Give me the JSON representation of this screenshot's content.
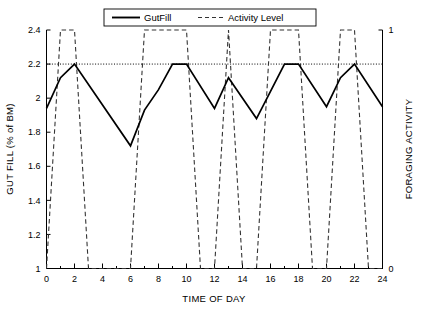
{
  "chart_data": {
    "type": "line",
    "title": "",
    "xlabel": "TIME OF DAY",
    "ylabel": "GUT FILL (% of BM)",
    "y2label": "FORAGING ACTIVITY",
    "xlim": [
      0,
      24
    ],
    "ylim": [
      1,
      2.4
    ],
    "y2lim": [
      0,
      1
    ],
    "xticks": [
      0,
      2,
      4,
      6,
      8,
      10,
      12,
      14,
      16,
      18,
      20,
      22,
      24
    ],
    "xtick_labels": [
      "0",
      "2",
      "4",
      "6",
      "8",
      "10",
      "12",
      "14",
      "16",
      "18",
      "20",
      "22",
      "24"
    ],
    "xminor_ticks": [
      1,
      3,
      5,
      7,
      9,
      11,
      13,
      15,
      17,
      19,
      21,
      23
    ],
    "yticks": [
      1,
      1.2,
      1.4,
      1.6,
      1.8,
      2,
      2.2,
      2.4
    ],
    "ytick_labels": [
      "1",
      "1.2",
      "1.4",
      "1.6",
      "1.8",
      "2",
      "2.2",
      "2.4"
    ],
    "y2ticks": [
      0,
      1
    ],
    "y2tick_labels": [
      "0",
      "1"
    ],
    "grid": false,
    "legend_position": "top-center",
    "reference_lines": [
      {
        "axis": "y",
        "value": 2.2,
        "style": "dotted",
        "color": "#000000"
      }
    ],
    "series": [
      {
        "name": "GutFill",
        "axis": "left",
        "style": "solid",
        "color": "#000000",
        "x": [
          0,
          1,
          2,
          6,
          7,
          8,
          9,
          10,
          12,
          13,
          15,
          16,
          17,
          18,
          20,
          21,
          22,
          24
        ],
        "values": [
          1.94,
          2.12,
          2.2,
          1.72,
          1.93,
          2.05,
          2.2,
          2.2,
          1.94,
          2.12,
          1.88,
          2.04,
          2.2,
          2.2,
          1.95,
          2.12,
          2.2,
          1.95
        ]
      },
      {
        "name": "Activity Level",
        "axis": "right",
        "style": "dashed",
        "color": "#333333",
        "x": [
          0,
          1,
          2,
          3,
          6,
          7,
          10,
          11,
          12,
          13,
          14,
          15,
          16,
          18,
          19,
          20,
          21,
          22,
          23,
          24
        ],
        "values": [
          0,
          1,
          1,
          0,
          0,
          1,
          1,
          0,
          0,
          1,
          0,
          0,
          1,
          1,
          0,
          0,
          1,
          1,
          0,
          0
        ]
      }
    ]
  },
  "legend": {
    "entries": [
      {
        "label": "GutFill",
        "style": "solid"
      },
      {
        "label": "Activity Level",
        "style": "dashed"
      }
    ]
  },
  "axes": {
    "x_title": "TIME OF DAY",
    "y_left_title": "GUT FILL (% of BM)",
    "y_right_title": "FORAGING ACTIVITY"
  }
}
